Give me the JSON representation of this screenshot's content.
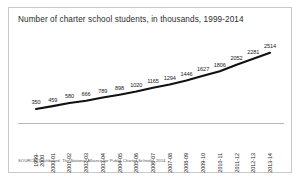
{
  "figure": {
    "title": "Number of charter school students, in thousands, 1999-2014",
    "source": "SOURCE: Dashboard, The National Alliance for Public Charter Schools, 2014.",
    "border_color": "#c9c9c9",
    "line_color": "#111111",
    "axis_color": "#b6b6b6",
    "background": "#ffffff"
  },
  "chart_data": {
    "type": "line",
    "title": "Number of charter school students, in thousands, 1999-2014",
    "xlabel": "",
    "ylabel": "",
    "ylim": [
      0,
      2700
    ],
    "grid": false,
    "legend": "none",
    "data_labels": true,
    "categories": [
      "1999-2000",
      "2000-01",
      "2001-02",
      "2002-03",
      "2003-04",
      "2004-05",
      "2005-06",
      "2006-07",
      "2007-08",
      "2008-09",
      "2009-10",
      "2010-11",
      "2011-12",
      "2012-13",
      "2013-14"
    ],
    "values": [
      350,
      459,
      580,
      666,
      789,
      898,
      1020,
      1165,
      1294,
      1446,
      1627,
      1806,
      2052,
      2281,
      2514
    ],
    "annotations": [
      "SOURCE: Dashboard, The National Alliance for Public Charter Schools, 2014."
    ]
  }
}
